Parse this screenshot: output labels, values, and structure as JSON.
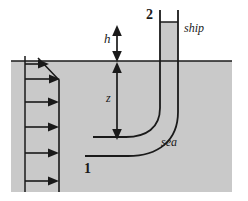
{
  "figure": {
    "canvas": {
      "width": 248,
      "height": 201
    },
    "colors": {
      "water_fill": "#c9c9c9",
      "line": "#1a1a1a",
      "background": "#ffffff"
    },
    "labels": {
      "h": "h",
      "z": "z",
      "point_1": "1",
      "point_2": "2",
      "ship": "ship",
      "sea": "sea"
    },
    "geometry": {
      "water_surface_y": 61,
      "water_left_x": 11,
      "water_right_x": 232,
      "water_bottom_y": 192,
      "pipe_inner_x": 160,
      "pipe_outer_x": 178,
      "pipe_top_y": 10,
      "pipe_fluid_top_y": 22,
      "dim_line_x": 117,
      "h_top_y": 28,
      "z_bottom_y": 137,
      "profile_tail_x": 25,
      "profile_face_x": 59,
      "arrow_count": 6
    },
    "velocity_profile": {
      "description": "horizontal velocity arrows decreasing near free surface",
      "arrow_rows_y": [
        63,
        78,
        97,
        118,
        140,
        163,
        183
      ],
      "arrows": [
        {
          "y": 63,
          "tail_x": 25,
          "tip_x": 45
        },
        {
          "y": 78,
          "tail_x": 25,
          "tip_x": 58
        },
        {
          "y": 101,
          "tail_x": 25,
          "tip_x": 59
        },
        {
          "y": 126,
          "tail_x": 25,
          "tip_x": 59
        },
        {
          "y": 152,
          "tail_x": 25,
          "tip_x": 59
        },
        {
          "y": 180,
          "tail_x": 25,
          "tip_x": 59
        }
      ]
    }
  }
}
